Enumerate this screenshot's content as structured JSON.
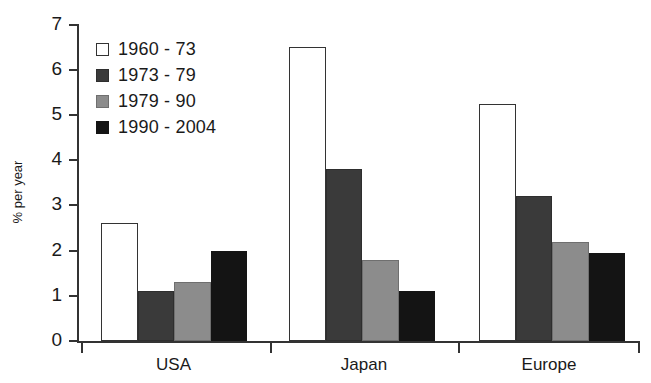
{
  "chart_data": {
    "type": "bar",
    "title": "",
    "subtitle": "",
    "xlabel": "",
    "ylabel": "% per year",
    "categories": [
      "USA",
      "Japan",
      "Europe"
    ],
    "series": [
      {
        "name": "1960 - 73",
        "color": "#ffffff",
        "values": [
          2.6,
          6.5,
          5.25
        ]
      },
      {
        "name": "1973 - 79",
        "color": "#3a3a3a",
        "values": [
          1.1,
          3.8,
          3.2
        ]
      },
      {
        "name": "1979 - 90",
        "color": "#8c8c8c",
        "values": [
          1.3,
          1.8,
          2.2
        ]
      },
      {
        "name": "1990 - 2004",
        "color": "#141414",
        "values": [
          2.0,
          1.1,
          1.95
        ]
      }
    ],
    "ylim": [
      0,
      7
    ],
    "yticks": [
      0,
      1,
      2,
      3,
      4,
      5,
      6,
      7
    ],
    "ytick_labels": [
      "0",
      "1",
      "2",
      "3",
      "4",
      "5",
      "6",
      "7"
    ],
    "grid": false,
    "legend_position": "top-left",
    "annotations": []
  },
  "legend": {
    "items": [
      {
        "label": "1960 - 73"
      },
      {
        "label": "1973 - 79"
      },
      {
        "label": "1979 - 90"
      },
      {
        "label": "1990 - 2004"
      }
    ]
  },
  "axes": {
    "y_title": "% per year",
    "y_labels": [
      "0",
      "1",
      "2",
      "3",
      "4",
      "5",
      "6",
      "7"
    ],
    "x_labels": [
      "USA",
      "Japan",
      "Europe"
    ]
  }
}
